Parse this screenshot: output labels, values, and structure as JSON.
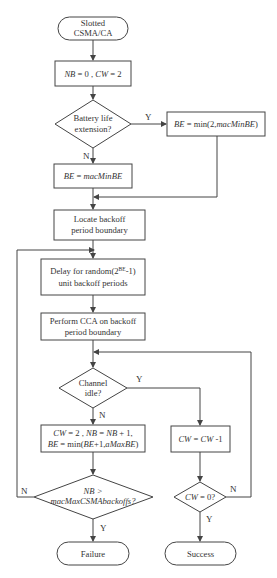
{
  "diagram": {
    "type": "flowchart",
    "colors": {
      "stroke": "#444444",
      "text": "#333333",
      "background": "#ffffff"
    },
    "nodes": {
      "start": {
        "shape": "terminal",
        "line1": "Slotted",
        "line2": "CSMA/CA"
      },
      "init": {
        "shape": "process",
        "nb": "NB",
        "eq0": " = 0 , ",
        "cw": "CW",
        "eq2": " = 2"
      },
      "battery": {
        "shape": "decision",
        "line1": "Battery life",
        "line2": "extension?"
      },
      "be_min": {
        "shape": "process",
        "be": "BE",
        "eq": " = min(2,",
        "mac": "macMinBE",
        "close": ")"
      },
      "be_mac": {
        "shape": "process",
        "be": "BE",
        "eq": " = ",
        "mac": "macMinBE"
      },
      "locate": {
        "shape": "process",
        "line1": "Locate backoff",
        "line2": "period boundary"
      },
      "delay": {
        "shape": "process",
        "line1_a": "Delay for random(2",
        "line1_sup": "BE",
        "line1_b": "-1)",
        "line2": "unit backoff periods"
      },
      "cca": {
        "shape": "process",
        "line1": "Perform CCA on backoff",
        "line2": "period boundary"
      },
      "channel": {
        "shape": "decision",
        "line1": "Channel",
        "line2": "idle?"
      },
      "update": {
        "shape": "process",
        "l1_cw": "CW",
        "l1_a": " = 2 , ",
        "l1_nb": "NB",
        "l1_b": " = ",
        "l1_nb2": "NB",
        "l1_c": " + 1,",
        "l2_be": "BE",
        "l2_a": " = min(",
        "l2_be2": "BE",
        "l2_b": "+1,",
        "l2_max": "aMaxBE",
        "l2_c": ")"
      },
      "nb_check": {
        "shape": "decision",
        "line1": "NB >",
        "line2": "macMaxCSMAbackoffs?"
      },
      "cw_dec": {
        "shape": "process",
        "cw": "CW",
        "eq": " = ",
        "cw2": "CW",
        "tail": " -1"
      },
      "cw_check": {
        "shape": "decision",
        "cw": "CW",
        "tail": " = 0?"
      },
      "failure": {
        "shape": "terminal",
        "label": "Failure"
      },
      "success": {
        "shape": "terminal",
        "label": "Success"
      }
    },
    "edge_labels": {
      "battery_yes": "Y",
      "battery_no": "N",
      "channel_yes": "Y",
      "channel_no": "N",
      "nb_no": "N",
      "nb_yes": "Y",
      "cw_no": "N",
      "cw_yes": "Y"
    }
  }
}
